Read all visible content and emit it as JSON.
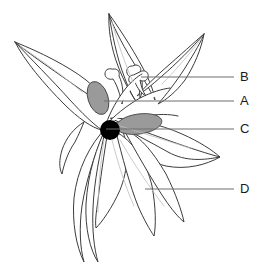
{
  "figure": {
    "type": "botanical-line-drawing",
    "background_color": "#ffffff",
    "outline_color": "#3c3c3c",
    "leader_line_color": "#6e6e6e",
    "anther_fill_color": "#9a9a9a",
    "ovary_fill_color": "#000000",
    "vein_color": "#b4b4b4"
  },
  "labels": [
    {
      "id": "b",
      "text": "B",
      "points_to": "anther",
      "leader_line": {
        "x1": 141,
        "y1": 77,
        "x2": 234,
        "y2": 77
      }
    },
    {
      "id": "a",
      "text": "A",
      "points_to": "filament",
      "leader_line": {
        "x1": 104,
        "y1": 101,
        "x2": 234,
        "y2": 101
      }
    },
    {
      "id": "c",
      "text": "C",
      "points_to": "ovary",
      "leader_line": {
        "x1": 106,
        "y1": 129,
        "x2": 234,
        "y2": 129
      }
    },
    {
      "id": "d",
      "text": "D",
      "points_to": "petal",
      "leader_line": {
        "x1": 145,
        "y1": 189,
        "x2": 234,
        "y2": 189
      }
    }
  ],
  "parts": {
    "petals": [
      {
        "name": "petal-upper-left",
        "description": "long narrow petal angled up and left"
      },
      {
        "name": "petal-upper-center",
        "description": "narrow petal pointing straight up"
      },
      {
        "name": "petal-upper-right",
        "description": "petal angled up and right"
      },
      {
        "name": "petal-right",
        "description": "petal extending to the right"
      },
      {
        "name": "petal-lower-left",
        "description": "petal hanging down-left"
      },
      {
        "name": "petal-lower-center",
        "description": "petal hanging down"
      },
      {
        "name": "petal-lower-right",
        "description": "petal hanging down-right"
      }
    ],
    "reproductive": [
      {
        "name": "anther-left",
        "fill": "#9a9a9a"
      },
      {
        "name": "anther-right",
        "fill": "#9a9a9a"
      },
      {
        "name": "ovary",
        "fill": "#000000"
      },
      {
        "name": "style",
        "fill": "none"
      },
      {
        "name": "stamen-cluster",
        "fill": "none"
      }
    ]
  }
}
